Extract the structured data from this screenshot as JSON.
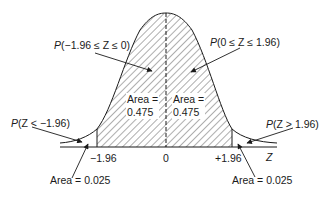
{
  "diagram": {
    "type": "standard normal distribution",
    "axis_label": "Z",
    "ticks": [
      {
        "label": "−1.96",
        "value": -1.96
      },
      {
        "label": "0",
        "value": 0
      },
      {
        "label": "+1.96",
        "value": 1.96
      }
    ],
    "shaded_region": {
      "from": -1.96,
      "to": 1.96,
      "pattern": "diagonal hatch"
    },
    "center_line": "dashed",
    "annotations": {
      "left_center": {
        "prob_prefix": "P",
        "expr": "(−1.96 ≤ Z ≤ 0)"
      },
      "right_center": {
        "prob_prefix": "P",
        "expr": "(0 ≤ Z ≤ 1.96)"
      },
      "left_tail": {
        "prob_prefix": "P",
        "expr": "(Z < −1.96)"
      },
      "right_tail": {
        "prob_prefix": "P",
        "expr": "(Z > 1.96)"
      }
    },
    "areas": {
      "left_center": {
        "label": "Area =",
        "value": "0.475"
      },
      "right_center": {
        "label": "Area =",
        "value": "0.475"
      },
      "left_tail": {
        "text": "Area = 0.025"
      },
      "right_tail": {
        "text": "Area = 0.025"
      }
    },
    "colors": {
      "line": "#1a1a1a",
      "hatch": "#333333",
      "background": "#ffffff"
    }
  }
}
